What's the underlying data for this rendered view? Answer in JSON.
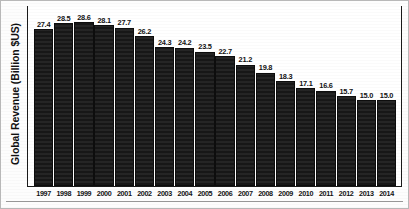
{
  "chart_data": {
    "type": "bar",
    "title": "",
    "xlabel": "",
    "ylabel": "Global Revenue (Billion $US)",
    "grid": false,
    "legend": false,
    "ylim": [
      0,
      30
    ],
    "categories": [
      "1997",
      "1998",
      "1999",
      "2000",
      "2001",
      "2002",
      "2003",
      "2004",
      "2005",
      "2006",
      "2007",
      "2008",
      "2009",
      "2010",
      "2011",
      "2012",
      "2013",
      "2014"
    ],
    "values": [
      27.4,
      28.5,
      28.6,
      28.1,
      27.7,
      26.2,
      24.3,
      24.2,
      23.5,
      22.7,
      21.2,
      19.8,
      18.3,
      17.1,
      16.6,
      15.7,
      15.0,
      15.0
    ],
    "value_labels": [
      "27.4",
      "28.5",
      "28.6",
      "28.1",
      "27.7",
      "26.2",
      "24.3",
      "24.2",
      "23.5",
      "22.7",
      "21.2",
      "19.8",
      "18.3",
      "17.1",
      "16.6",
      "15.7",
      "15.0",
      "15.0"
    ],
    "bar_color": "#1b1b1b",
    "bar_edge_color": "#ffffff",
    "axis_color": "#1a1a1a",
    "background_color": "#ffffff"
  }
}
